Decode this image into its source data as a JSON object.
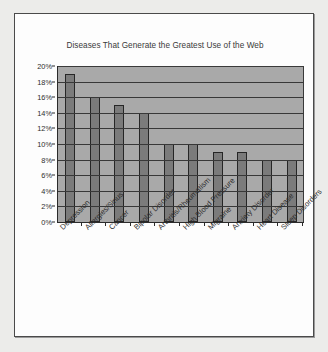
{
  "chart_data": {
    "type": "bar",
    "title": "Diseases That Generate the Greatest Use of the Web",
    "xlabel": "",
    "ylabel": "",
    "ylim": [
      0,
      20
    ],
    "ytick_step": 2,
    "ytick_labels": [
      "0%",
      "2%",
      "4%",
      "6%",
      "8%",
      "10%",
      "12%",
      "14%",
      "16%",
      "18%",
      "20%"
    ],
    "ytick_values": [
      0,
      2,
      4,
      6,
      8,
      10,
      12,
      14,
      16,
      18,
      20
    ],
    "grid": true,
    "legend": null,
    "categories": [
      "Depression",
      "Allergies/Sinus",
      "Cancer",
      "Bipolar Disorder",
      "Arthritis/Rheumatism",
      "High Blood Pressure",
      "Migraine",
      "Anxiety Disorder",
      "Heart Disease",
      "Sleep Disorders"
    ],
    "values": [
      19,
      16,
      15,
      14,
      10,
      10,
      9,
      9,
      8,
      8
    ],
    "value_unit": "%",
    "colors": {
      "bar_fill": "#7b7b7b",
      "bar_border": "#262626",
      "plot_background": "#a9a9a9",
      "gridline": "#383838",
      "axis": "#2b2b2b",
      "card_background": "#fdfdfd",
      "card_border": "#4a4a4a",
      "page_background": "#ececea",
      "text": "#2e2e2e"
    }
  }
}
